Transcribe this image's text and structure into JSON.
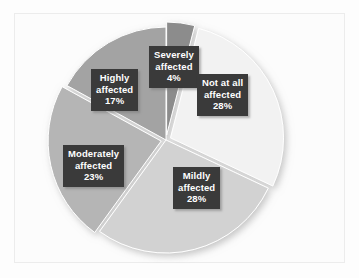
{
  "chart_data": {
    "type": "pie",
    "title": "",
    "subtitle": "",
    "xlabel": "",
    "ylabel": "",
    "legend": "none",
    "grid": false,
    "labels_inside": true,
    "start_angle_deg": 0,
    "direction": "clockwise",
    "categories": [
      "Severely affected",
      "Not at all affected",
      "Mildly affected",
      "Moderately affected",
      "Highly affected"
    ],
    "values": [
      4,
      28,
      28,
      23,
      17
    ],
    "value_suffix": "%",
    "slices": [
      {
        "name": "Severely affected",
        "label_line1": "Severely",
        "label_line2": "affected",
        "percent_text": "4%",
        "value": 4,
        "color": "#8c8c8c",
        "exploded": true
      },
      {
        "name": "Not at all affected",
        "label_line1": "Not at all",
        "label_line2": "affected",
        "percent_text": "28%",
        "value": 28,
        "color": "#f2f2f2",
        "exploded": true
      },
      {
        "name": "Mildly affected",
        "label_line1": "Mildly",
        "label_line2": "affected",
        "percent_text": "28%",
        "value": 28,
        "color": "#d2d2d2",
        "exploded": false
      },
      {
        "name": "Moderately affected",
        "label_line1": "Moderately",
        "label_line2": "affected",
        "percent_text": "23%",
        "value": 23,
        "color": "#b5b5b5",
        "exploded": true
      },
      {
        "name": "Highly affected",
        "label_line1": "Highly",
        "label_line2": "affected",
        "percent_text": "17%",
        "value": 17,
        "color": "#a3a3a3",
        "exploded": false
      }
    ],
    "label_box_color": "#3a3a3a",
    "label_text_color": "#ffffff",
    "background_color": "#fcfcfc",
    "frame_border_color": "#ececec"
  }
}
